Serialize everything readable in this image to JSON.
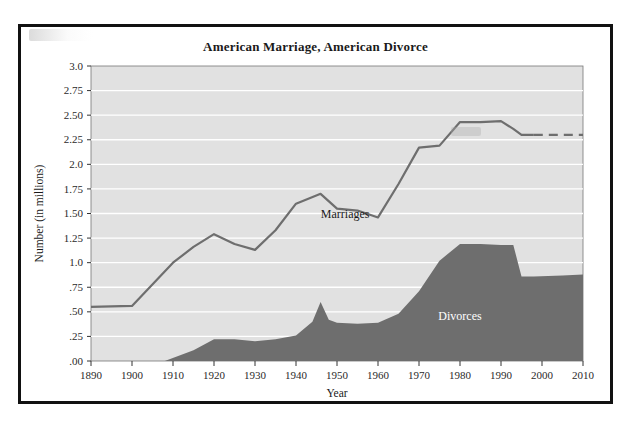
{
  "figure": {
    "title": "American Marriage, American Divorce"
  },
  "chart_data": {
    "type": "area",
    "title": "American Marriage, American Divorce",
    "xlabel": "Year",
    "ylabel": "Number (in millions)",
    "xlim": [
      1890,
      2010
    ],
    "ylim": [
      0.0,
      3.0
    ],
    "grid": true,
    "legend_position": "inline-annotation",
    "x_tick_labels": [
      "1890",
      "1900",
      "1910",
      "1920",
      "1930",
      "1940",
      "1950",
      "1960",
      "1970",
      "1980",
      "1990",
      "2000",
      "2010"
    ],
    "x_ticks": [
      1890,
      1900,
      1910,
      1920,
      1930,
      1940,
      1950,
      1960,
      1970,
      1980,
      1990,
      2000,
      2010
    ],
    "y_tick_labels": [
      "3.0",
      "2.75",
      "2.50",
      "2.25",
      "2.0",
      "1.75",
      "1.50",
      "1.25",
      "1.0",
      ".75",
      ".50",
      ".25",
      ".00"
    ],
    "y_ticks": [
      3.0,
      2.75,
      2.5,
      2.25,
      2.0,
      1.75,
      1.5,
      1.25,
      1.0,
      0.75,
      0.5,
      0.25,
      0.0
    ],
    "annotations": [
      {
        "text": "Marriages",
        "x": 1952,
        "y": 1.45
      },
      {
        "text": "Divorces",
        "x": 1980,
        "y": 0.42
      }
    ],
    "series": [
      {
        "name": "Marriages",
        "style": "line",
        "color": "#6e6e6e",
        "x": [
          1890,
          1900,
          1910,
          1915,
          1920,
          1925,
          1930,
          1935,
          1940,
          1946,
          1950,
          1955,
          1960,
          1965,
          1970,
          1975,
          1980,
          1985,
          1990,
          1993,
          1995,
          1998
        ],
        "values": [
          0.55,
          0.56,
          1.0,
          1.16,
          1.29,
          1.19,
          1.13,
          1.33,
          1.6,
          1.7,
          1.55,
          1.53,
          1.46,
          1.8,
          2.17,
          2.19,
          2.43,
          2.43,
          2.44,
          2.36,
          2.3,
          2.3
        ]
      },
      {
        "name": "Marriages (projected)",
        "style": "dashed-line",
        "color": "#6e6e6e",
        "x": [
          1998,
          2010
        ],
        "values": [
          2.3,
          2.3
        ]
      },
      {
        "name": "Divorces",
        "style": "filled-area",
        "color": "#6e6e6e",
        "x": [
          1890,
          1900,
          1908,
          1915,
          1920,
          1925,
          1930,
          1935,
          1940,
          1944,
          1946,
          1948,
          1950,
          1955,
          1960,
          1965,
          1970,
          1975,
          1980,
          1985,
          1990,
          1993,
          1995,
          1998,
          2005,
          2010
        ],
        "values": [
          0.0,
          0.0,
          0.0,
          0.11,
          0.22,
          0.22,
          0.2,
          0.22,
          0.26,
          0.4,
          0.6,
          0.42,
          0.39,
          0.38,
          0.39,
          0.48,
          0.71,
          1.02,
          1.19,
          1.19,
          1.18,
          1.18,
          0.86,
          0.86,
          0.87,
          0.88
        ]
      }
    ]
  },
  "colors": {
    "plot_background": "#e1e1e1",
    "gridline": "#ffffff",
    "marriage_line": "#6e6e6e",
    "divorce_fill": "#6e6e6e",
    "frame": "#111111",
    "text": "#1a1a1a"
  }
}
